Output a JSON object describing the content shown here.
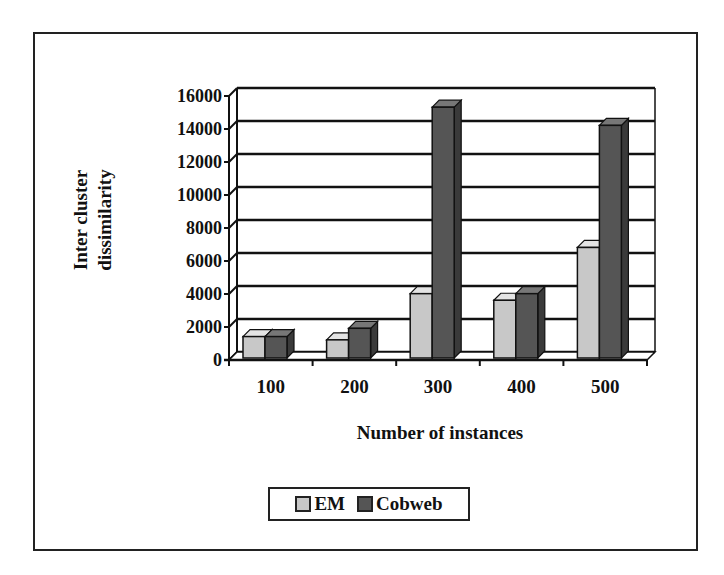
{
  "chart_data": {
    "type": "bar",
    "style": "3d-clustered-column",
    "title": "",
    "xlabel": "Number of instances",
    "ylabel": "Inter cluster dissimilarity",
    "ylabel_lines": [
      "Inter cluster",
      "dissimilarity"
    ],
    "categories": [
      "100",
      "200",
      "300",
      "400",
      "500"
    ],
    "series": [
      {
        "name": "EM",
        "color": "#c8c8c8",
        "values": [
          1300,
          1100,
          3900,
          3500,
          6700
        ]
      },
      {
        "name": "Cobweb",
        "color": "#555555",
        "values": [
          1300,
          1800,
          15200,
          3900,
          14100
        ]
      }
    ],
    "ylim": [
      0,
      16000
    ],
    "yticks": [
      0,
      2000,
      4000,
      6000,
      8000,
      10000,
      12000,
      14000,
      16000
    ],
    "ytick_labels": [
      "0",
      "2000",
      "4000",
      "6000",
      "8000",
      "10000",
      "12000",
      "14000",
      "16000"
    ],
    "grid": true,
    "legend_position": "bottom"
  },
  "legend": {
    "items": [
      {
        "label": "EM",
        "color": "#c8c8c8"
      },
      {
        "label": "Cobweb",
        "color": "#555555"
      }
    ]
  }
}
